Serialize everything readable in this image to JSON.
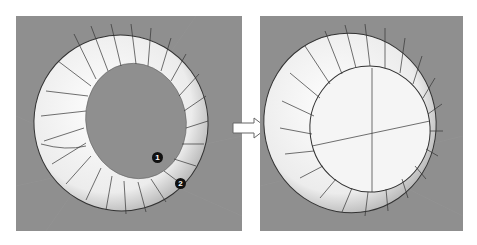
{
  "figure": {
    "colors": {
      "background": "#ffffff",
      "viewport": "#8f8f8f",
      "surface": "#f4f4f4",
      "isocurve": "#333333",
      "marker": "#111111",
      "arrow_fill": "#ffffff",
      "arrow_stroke": "#666666"
    }
  },
  "panels": [
    {
      "id": "before",
      "label": "",
      "markers": [
        {
          "label": "1"
        },
        {
          "label": "2"
        }
      ]
    },
    {
      "id": "after",
      "label": ""
    }
  ],
  "arrow": {
    "direction": "right"
  }
}
